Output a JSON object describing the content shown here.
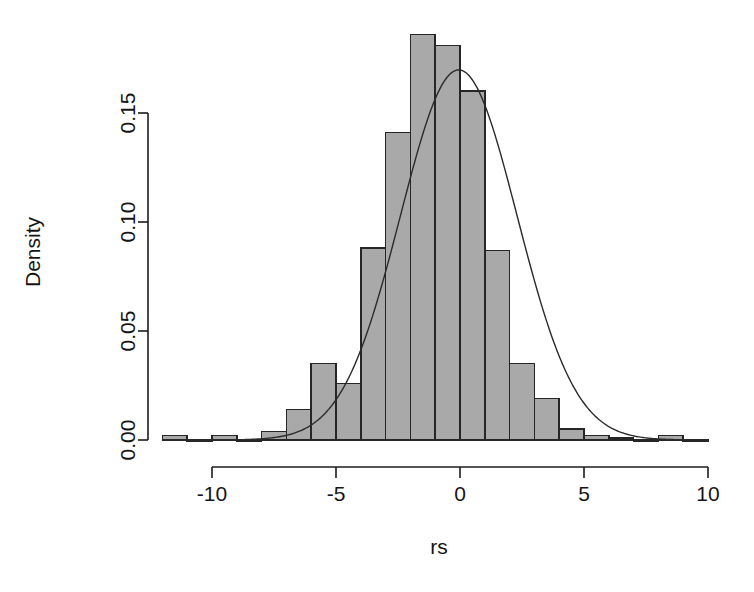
{
  "chart_data": {
    "type": "bar",
    "subtype": "histogram-with-density-overlay",
    "title": "",
    "xlabel": "rs",
    "ylabel": "Density",
    "xlim": [
      -12,
      10
    ],
    "ylim": [
      0,
      0.192
    ],
    "grid": false,
    "legend": null,
    "bin_width": 1,
    "bin_edges": [
      -12,
      -11,
      -10,
      -9,
      -8,
      -7,
      -6,
      -5,
      -4,
      -3,
      -2,
      -1,
      0,
      1,
      2,
      3,
      4,
      5,
      6,
      7,
      8,
      9,
      10
    ],
    "bin_centers": [
      -11.5,
      -10.5,
      -9.5,
      -8.5,
      -7.5,
      -6.5,
      -5.5,
      -4.5,
      -3.5,
      -2.5,
      -1.5,
      -0.5,
      0.5,
      1.5,
      2.5,
      3.5,
      4.5,
      5.5,
      6.5,
      7.5,
      8.5,
      9.5
    ],
    "categories": [
      "-11.5",
      "-10.5",
      "-9.5",
      "-8.5",
      "-7.5",
      "-6.5",
      "-5.5",
      "-4.5",
      "-3.5",
      "-2.5",
      "-1.5",
      "-0.5",
      "0.5",
      "1.5",
      "2.5",
      "3.5",
      "4.5",
      "5.5",
      "6.5",
      "7.5",
      "8.5",
      "9.5"
    ],
    "values": [
      0.002,
      0.0,
      0.002,
      0.0,
      0.004,
      0.014,
      0.035,
      0.026,
      0.088,
      0.141,
      0.186,
      0.181,
      0.16,
      0.087,
      0.035,
      0.019,
      0.005,
      0.002,
      0.001,
      0.0,
      0.002,
      0.0
    ],
    "xticks": [
      -10,
      -5,
      0,
      5,
      10
    ],
    "xticklabels": [
      "-10",
      "-5",
      "0",
      "5",
      "10"
    ],
    "yticks": [
      0.0,
      0.05,
      0.1,
      0.15
    ],
    "yticklabels": [
      "0.00",
      "0.05",
      "0.10",
      "0.15"
    ],
    "overlay": {
      "name": "normal-density",
      "type": "line",
      "mean": -0.05,
      "sd": 2.35,
      "peak": 0.1695,
      "x_range": [
        -12,
        10
      ]
    },
    "colors": {
      "bar_fill": "#a9a9a9",
      "bar_stroke": "#262626",
      "curve": "#2b2b2b",
      "axis": "#1c1c1c",
      "background": "#ffffff",
      "text": "#151515"
    }
  },
  "axes": {
    "x_title": "rs",
    "y_title": "Density"
  }
}
